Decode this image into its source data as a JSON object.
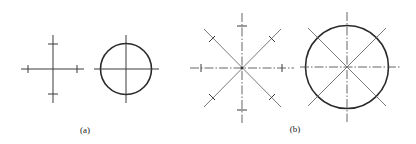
{
  "figure": {
    "panels": [
      {
        "id": "a",
        "label": "(a)",
        "elements": [
          {
            "type": "cross-with-ticks",
            "line_style": "solid",
            "ticks": 4
          },
          {
            "type": "circle-with-centerlines",
            "line_style": "solid"
          }
        ]
      },
      {
        "id": "b",
        "label": "(b)",
        "elements": [
          {
            "type": "star-with-ticks",
            "centerline_style": "dash-dot",
            "diagonal_style": "solid",
            "ticks": 8
          },
          {
            "type": "circle-with-centerlines-and-diagonals",
            "centerline_style": "dash-dot",
            "diagonal_style": "solid"
          }
        ]
      }
    ]
  }
}
